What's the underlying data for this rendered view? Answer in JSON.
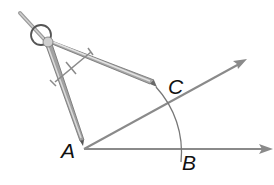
{
  "diagram": {
    "points": [
      {
        "id": "A",
        "label": "A",
        "x": 84,
        "y": 149
      },
      {
        "id": "B",
        "label": "B",
        "x": 180,
        "y": 149
      },
      {
        "id": "C",
        "label": "C",
        "x": 167,
        "y": 104
      }
    ],
    "rays": [
      {
        "from": "A",
        "through": "B",
        "end": [
          272,
          149
        ]
      },
      {
        "from": "A",
        "through": "C",
        "end": [
          246,
          60
        ]
      }
    ],
    "arc": {
      "center": "A",
      "radius": 96
    },
    "tool": "compass",
    "colors": {
      "ray": "#8a8a8a",
      "arc": "#777777",
      "label": "#111111",
      "compass_light": "#d8d8d8",
      "compass_dark": "#7a7a7a"
    }
  },
  "labels": {
    "A": "A",
    "B": "B",
    "C": "C"
  }
}
